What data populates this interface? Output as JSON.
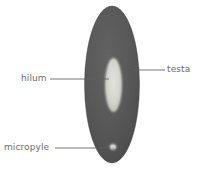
{
  "figure": {
    "type": "biological-diagram",
    "background_color": "#ffffff"
  },
  "seed": {
    "testa_fill_color": "#5b5b5b",
    "testa_edge_color": "#4a4a4a",
    "hilum_fill_color": "#d8d8d2",
    "micropyle_fill_color": "#cfcfc8"
  },
  "labels": {
    "hilum": "hilum",
    "testa": "testa",
    "micropyle": "micropyle",
    "text_color": "#6d6d6d",
    "leader_color": "#5f5f5f"
  }
}
